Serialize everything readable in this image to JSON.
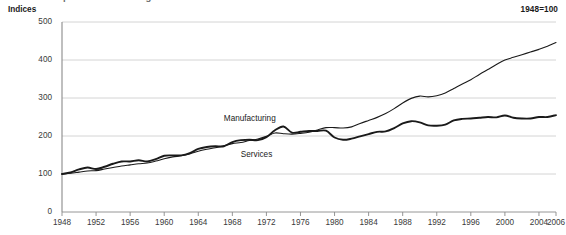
{
  "figure": {
    "clipped_title": "Index of output: manufacturing and services",
    "y_axis_title": "Indices",
    "base_note": "1948=100"
  },
  "chart_data": {
    "type": "line",
    "title": "Index of output: manufacturing and services",
    "subtitle": "",
    "xlabel": "",
    "ylabel": "Indices",
    "annotation": "1948=100",
    "xlim": [
      1948,
      2006
    ],
    "ylim": [
      0,
      500
    ],
    "yticks": [
      0,
      100,
      200,
      300,
      400,
      500
    ],
    "ytick_labels": [
      "0",
      "100",
      "200",
      "300",
      "400",
      "500"
    ],
    "xticks": [
      1948,
      1952,
      1956,
      1960,
      1964,
      1968,
      1972,
      1976,
      1980,
      1984,
      1988,
      1992,
      1996,
      2000,
      2004,
      2006
    ],
    "xtick_labels": [
      "1948",
      "1952",
      "1956",
      "1960",
      "1964",
      "1968",
      "1972",
      "1976",
      "1980",
      "1984",
      "1988",
      "1992",
      "1996",
      "2000",
      "2004",
      "2006"
    ],
    "grid": "horizontal",
    "legend_position": "inline-labels",
    "x": [
      1948,
      1949,
      1950,
      1951,
      1952,
      1953,
      1954,
      1955,
      1956,
      1957,
      1958,
      1959,
      1960,
      1961,
      1962,
      1963,
      1964,
      1965,
      1966,
      1967,
      1968,
      1969,
      1970,
      1971,
      1972,
      1973,
      1974,
      1975,
      1976,
      1977,
      1978,
      1979,
      1980,
      1981,
      1982,
      1983,
      1984,
      1985,
      1986,
      1987,
      1988,
      1989,
      1990,
      1991,
      1992,
      1993,
      1994,
      1995,
      1996,
      1997,
      1998,
      1999,
      2000,
      2001,
      2002,
      2003,
      2004,
      2005,
      2006
    ],
    "series": [
      {
        "name": "Manufacturing",
        "color": "#1a1a1a",
        "line_width": 1.9,
        "label_x": 1967,
        "label_y": 243,
        "values": [
          100,
          104,
          112,
          117,
          113,
          119,
          127,
          133,
          133,
          136,
          133,
          139,
          148,
          149,
          149,
          155,
          166,
          171,
          173,
          173,
          184,
          189,
          190,
          189,
          197,
          215,
          225,
          209,
          211,
          213,
          213,
          214,
          196,
          190,
          193,
          199,
          205,
          211,
          212,
          221,
          233,
          239,
          236,
          228,
          227,
          230,
          241,
          245,
          246,
          248,
          250,
          249,
          254,
          248,
          246,
          246,
          250,
          250,
          255
        ]
      },
      {
        "name": "Services",
        "color": "#1a1a1a",
        "line_width": 1.1,
        "label_x": 1969,
        "label_y": 148,
        "values": [
          100,
          102,
          105,
          108,
          109,
          113,
          117,
          121,
          124,
          127,
          129,
          134,
          140,
          145,
          148,
          153,
          160,
          165,
          169,
          174,
          180,
          183,
          188,
          192,
          199,
          208,
          206,
          205,
          207,
          210,
          216,
          222,
          222,
          221,
          224,
          233,
          241,
          249,
          259,
          272,
          287,
          299,
          305,
          303,
          306,
          313,
          325,
          337,
          348,
          362,
          375,
          388,
          400,
          407,
          414,
          421,
          428,
          436,
          446
        ]
      }
    ]
  }
}
